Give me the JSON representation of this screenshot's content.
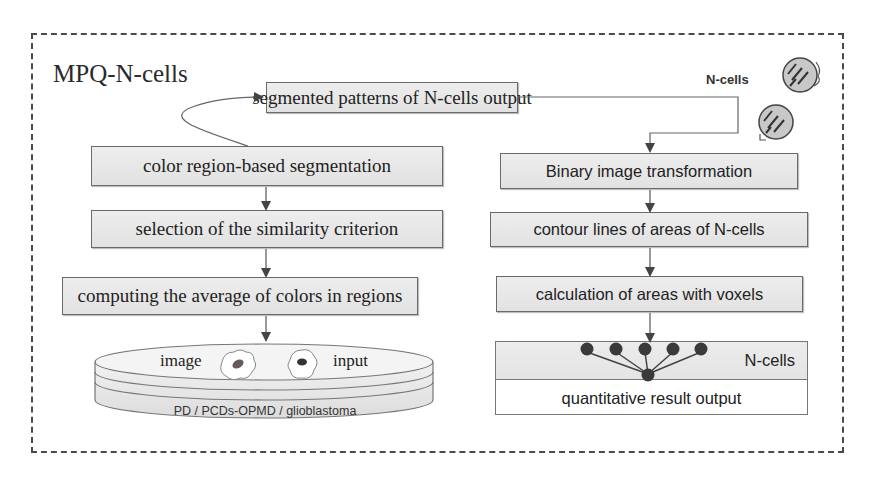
{
  "diagram": {
    "title": "MPQ-N-cells",
    "top_box": "segmented patterns of N-cells output",
    "left_pipeline": [
      "color region-based segmentation",
      "selection of the similarity criterion",
      "computing the average of colors in regions"
    ],
    "right_pipeline": [
      "Binary image transformation",
      "contour lines of areas of N-cells",
      "calculation of areas with voxels"
    ],
    "ncells_icon_label": "N-cells",
    "database": {
      "label_left": "image",
      "label_right": "input",
      "caption": "PD / PCDs-OPMD / glioblastoma"
    },
    "output": {
      "top_label": "N-cells",
      "bottom_label": "quantitative result output"
    },
    "colors": {
      "box_fill": "#e8e8e8",
      "border": "#6a6a6a",
      "frame": "#4a4a4a",
      "arrow": "#444444"
    }
  }
}
